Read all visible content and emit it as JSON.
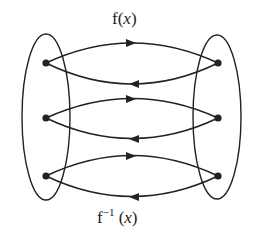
{
  "diagram": {
    "type": "function-mapping",
    "labels": {
      "forward": {
        "name": "f",
        "arg": "x",
        "open": "(",
        "close": ")"
      },
      "inverse": {
        "name": "f",
        "exponent": "−1",
        "arg": "x",
        "open": " (",
        "close": ")"
      }
    },
    "sets": [
      {
        "id": "domain",
        "side": "left",
        "elements": 3
      },
      {
        "id": "codomain",
        "side": "right",
        "elements": 3
      }
    ],
    "mappings": [
      {
        "from": "left-1",
        "to": "right-1",
        "direction": "forward"
      },
      {
        "from": "right-1",
        "to": "left-1",
        "direction": "inverse"
      },
      {
        "from": "left-2",
        "to": "right-2",
        "direction": "forward"
      },
      {
        "from": "right-2",
        "to": "left-2",
        "direction": "inverse"
      },
      {
        "from": "left-3",
        "to": "right-3",
        "direction": "forward"
      },
      {
        "from": "right-3",
        "to": "left-3",
        "direction": "inverse"
      }
    ],
    "colors": {
      "stroke": "#222222",
      "background": "#ffffff"
    }
  }
}
